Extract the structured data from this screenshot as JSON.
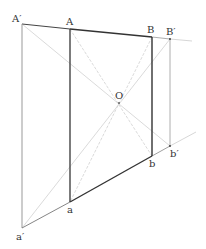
{
  "diagram": {
    "type": "geometric-construction",
    "labels": {
      "A_prime": "A′",
      "A": "A",
      "B": "B",
      "B_prime": "B′",
      "O": "O",
      "a_prime": "a′",
      "a": "a",
      "b": "b",
      "b_prime": "b′"
    },
    "points": {
      "A_prime": [
        22,
        24
      ],
      "A": [
        70,
        29
      ],
      "B": [
        152,
        37
      ],
      "B_prime": [
        170,
        39
      ],
      "O": [
        119,
        103
      ],
      "b_prime": [
        170,
        146
      ],
      "b": [
        152,
        156
      ],
      "a": [
        70,
        202
      ],
      "a_prime": [
        22,
        228
      ]
    },
    "colors": {
      "main": "#333333",
      "outer": "#888888",
      "construction": "#cccccc",
      "background": "#ffffff"
    }
  }
}
